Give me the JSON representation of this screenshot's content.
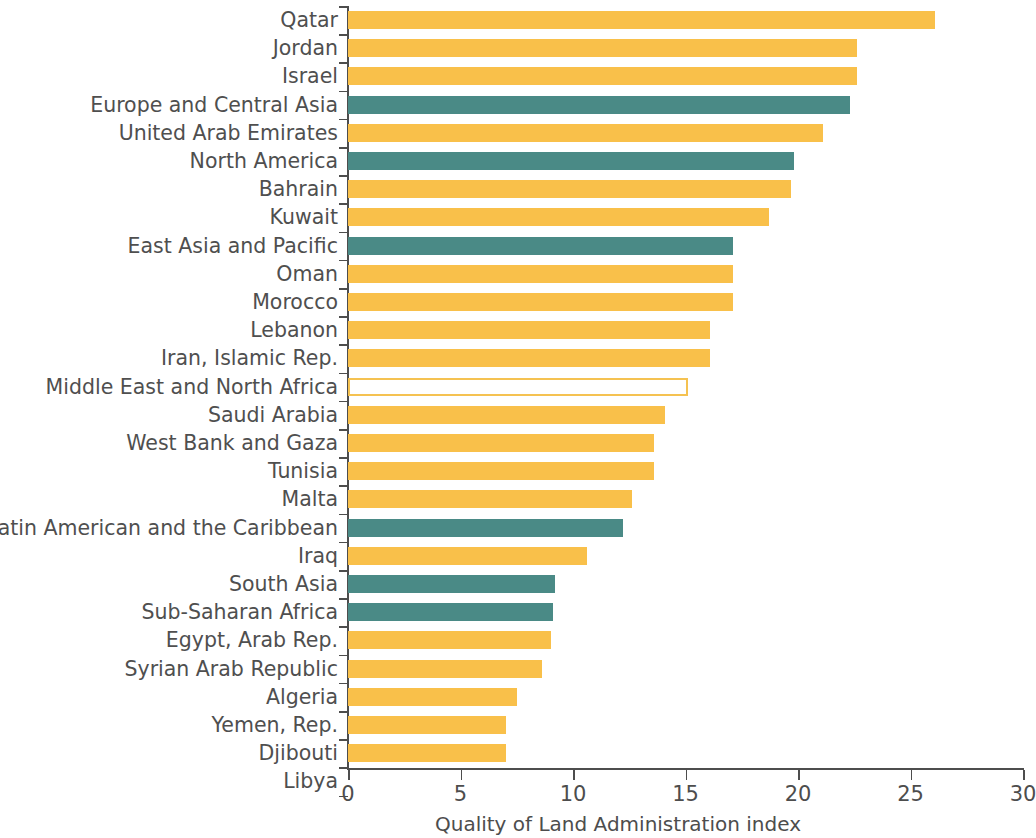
{
  "chart_data": {
    "type": "bar",
    "orientation": "horizontal",
    "title": "",
    "subtitle": "",
    "xlabel": "Quality of Land Administration index",
    "ylabel": "",
    "xlim": [
      0,
      30
    ],
    "xticks": [
      0,
      5,
      10,
      15,
      20,
      25,
      30
    ],
    "xtick_labels": [
      "0",
      "5",
      "10",
      "15",
      "20",
      "25",
      "30"
    ],
    "grid": false,
    "legend": null,
    "colors": {
      "country": "#f9c04a",
      "region": "#4a8a86",
      "highlight_fill": "#ffffff",
      "highlight_edge": "#f5c251",
      "axis": "#4d4d4d",
      "text": "#4f4f4f",
      "background": "#ffffff"
    },
    "categories": [
      "Qatar",
      "Jordan",
      "Israel",
      "Europe and Central Asia",
      "United Arab Emirates",
      "North America",
      "Bahrain",
      "Kuwait",
      "East Asia and Pacific",
      "Oman",
      "Morocco",
      "Lebanon",
      "Iran, Islamic Rep.",
      "Middle East and North Africa",
      "Saudi Arabia",
      "West Bank and Gaza",
      "Tunisia",
      "Malta",
      "Latin American and the Caribbean",
      "Iraq",
      "South Asia",
      "Sub-Saharan Africa",
      "Egypt, Arab Rep.",
      "Syrian Arab Republic",
      "Algeria",
      "Yemen, Rep.",
      "Djibouti",
      "Libya"
    ],
    "values": [
      26.1,
      22.6,
      22.6,
      22.3,
      21.1,
      19.8,
      19.7,
      18.7,
      17.1,
      17.1,
      17.1,
      16.1,
      16.1,
      15.1,
      14.1,
      13.6,
      13.6,
      12.6,
      12.2,
      10.6,
      9.2,
      9.1,
      9.0,
      8.6,
      7.5,
      7.0,
      7.0,
      0.0
    ],
    "bar_kinds": [
      "country",
      "country",
      "country",
      "region",
      "country",
      "region",
      "country",
      "country",
      "region",
      "country",
      "country",
      "country",
      "country",
      "highlight",
      "country",
      "country",
      "country",
      "country",
      "region",
      "country",
      "region",
      "region",
      "country",
      "country",
      "country",
      "country",
      "country",
      "country"
    ]
  }
}
